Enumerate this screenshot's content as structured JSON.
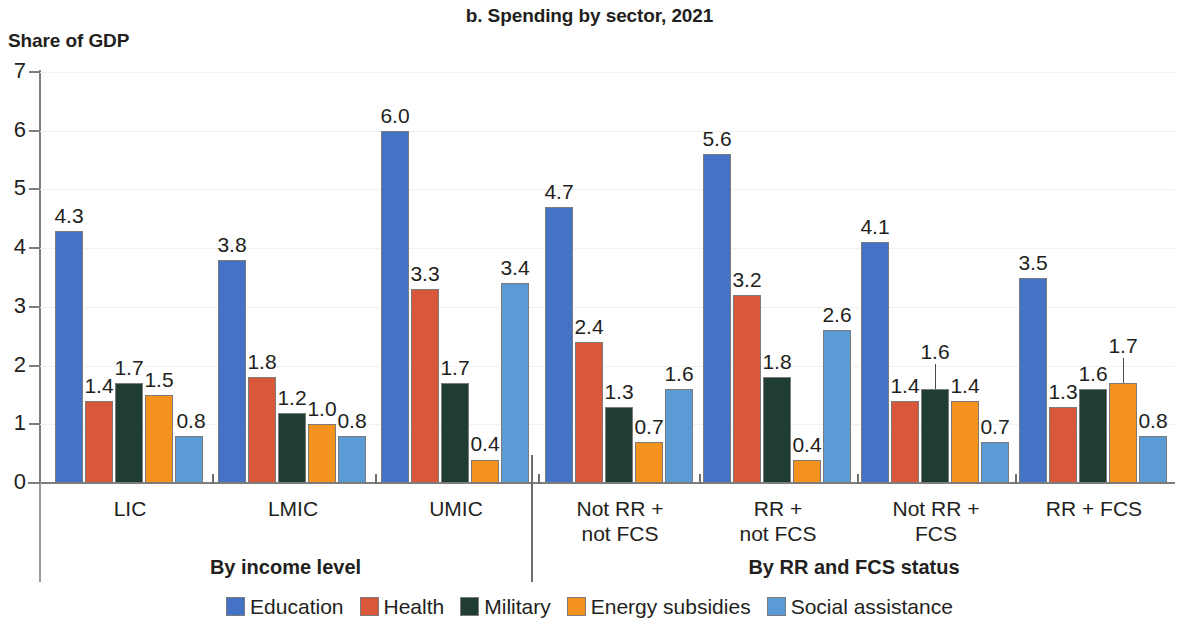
{
  "chart_data": {
    "type": "bar",
    "title": "b. Spending by sector, 2021",
    "ylabel": "Share of GDP",
    "xlabel": "",
    "ylim": [
      0,
      7
    ],
    "yticks": [
      0,
      1,
      2,
      3,
      4,
      5,
      6,
      7
    ],
    "grid": true,
    "legend_position": "bottom",
    "categories": [
      "LIC",
      "LMIC",
      "UMIC",
      "Not RR +\nnot FCS",
      "RR +\nnot FCS",
      "Not RR +\nFCS",
      "RR + FCS"
    ],
    "category_lines": [
      [
        "LIC"
      ],
      [
        "LMIC"
      ],
      [
        "UMIC"
      ],
      [
        "Not RR +",
        "not FCS"
      ],
      [
        "RR +",
        "not FCS"
      ],
      [
        "Not RR +",
        "FCS"
      ],
      [
        "RR + FCS"
      ]
    ],
    "series": [
      {
        "name": "Education",
        "color": "#4472c4",
        "values": [
          4.3,
          3.8,
          6.0,
          4.7,
          5.6,
          4.1,
          3.5
        ]
      },
      {
        "name": "Health",
        "color": "#d9583a",
        "values": [
          1.4,
          1.8,
          3.3,
          2.4,
          3.2,
          1.4,
          1.3
        ]
      },
      {
        "name": "Military",
        "color": "#1f3d32",
        "values": [
          1.7,
          1.2,
          1.7,
          1.3,
          1.8,
          1.6,
          1.6
        ]
      },
      {
        "name": "Energy subsidies",
        "color": "#f5921e",
        "values": [
          1.5,
          1.0,
          0.4,
          0.7,
          0.4,
          1.4,
          1.7
        ]
      },
      {
        "name": "Social assistance",
        "color": "#5b9bd5",
        "values": [
          0.8,
          0.8,
          3.4,
          1.6,
          2.6,
          0.7,
          0.8
        ]
      }
    ],
    "sections": [
      {
        "label": "By income level",
        "categories": [
          "LIC",
          "LMIC",
          "UMIC"
        ]
      },
      {
        "label": "By RR and FCS status",
        "categories": [
          "Not RR + not FCS",
          "RR + not FCS",
          "Not RR + FCS",
          "RR + FCS"
        ]
      }
    ]
  },
  "legend": {
    "items": [
      {
        "label": "Education",
        "color": "#4472c4"
      },
      {
        "label": "Health",
        "color": "#d9583a"
      },
      {
        "label": "Military",
        "color": "#1f3d32"
      },
      {
        "label": "Energy subsidies",
        "color": "#f5921e"
      },
      {
        "label": "Social assistance",
        "color": "#5b9bd5"
      }
    ]
  }
}
